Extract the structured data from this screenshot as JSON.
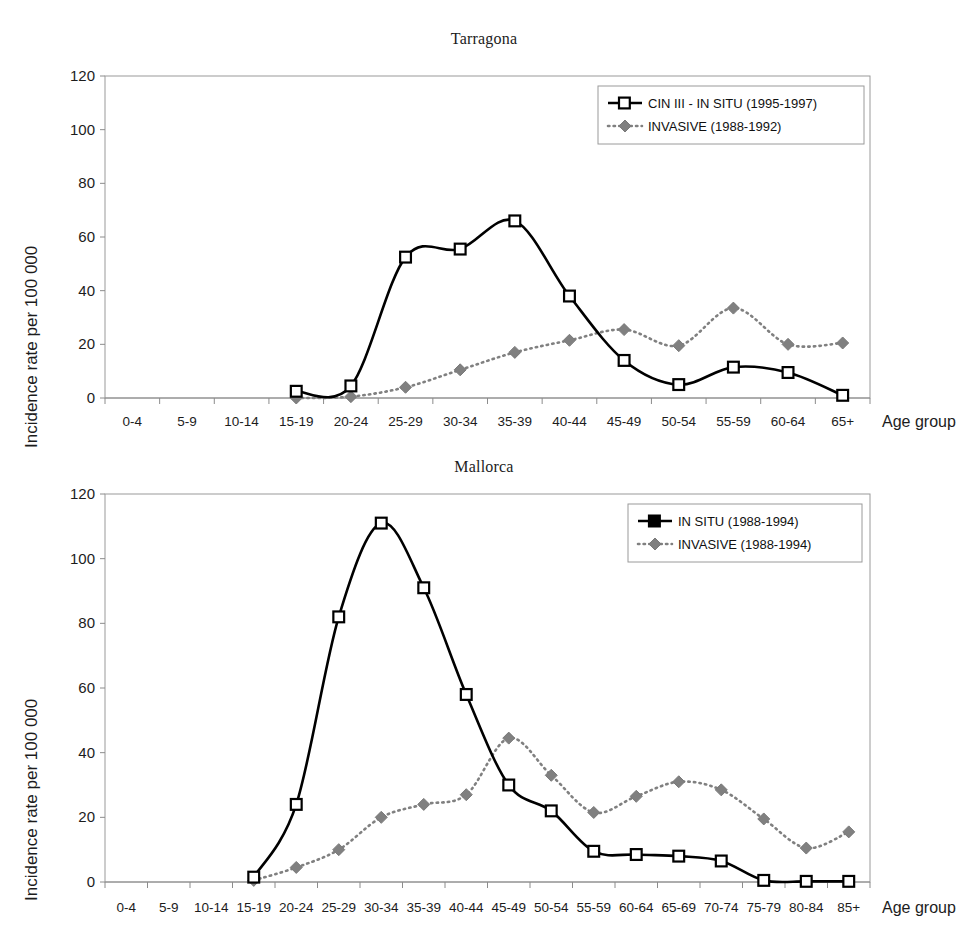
{
  "colors": {
    "insitu": "#000000",
    "invasive": "#808080",
    "axis": "#8c8c8c",
    "frame": "#9a9a9a",
    "text": "#1c1c1c",
    "background": "#ffffff"
  },
  "axis_caption": "Age group",
  "y_axis_title": "Incidence rate per 100 000",
  "charts": [
    {
      "id": "tarragona",
      "title": "Tarragona",
      "legend": {
        "insitu_label": "CIN III - IN SITU (1995-1997)",
        "invasive_label": "INVASIVE (1988-1992)"
      }
    },
    {
      "id": "mallorca",
      "title": "Mallorca",
      "legend": {
        "insitu_label": "IN SITU (1988-1994)",
        "invasive_label": "INVASIVE (1988-1994)"
      }
    }
  ],
  "chart_data": [
    {
      "type": "line",
      "title": "Tarragona",
      "xlabel": "Age group",
      "ylabel": "Incidence rate per 100 000",
      "ylim": [
        0,
        120
      ],
      "yticks": [
        0,
        20,
        40,
        60,
        80,
        100,
        120
      ],
      "grid": false,
      "legend_position": "top-right",
      "categories": [
        "0-4",
        "5-9",
        "10-14",
        "15-19",
        "20-24",
        "25-29",
        "30-34",
        "35-39",
        "40-44",
        "45-49",
        "50-54",
        "55-59",
        "60-64",
        "65+"
      ],
      "series": [
        {
          "name": "CIN III - IN SITU (1995-1997)",
          "marker": "open-square",
          "line": "solid",
          "color": "#000000",
          "values": [
            null,
            null,
            null,
            2.5,
            4.5,
            52.5,
            55.5,
            66.0,
            38.0,
            14.0,
            5.0,
            11.5,
            9.5,
            1.0
          ]
        },
        {
          "name": "INVASIVE (1988-1992)",
          "marker": "diamond",
          "line": "dotted",
          "color": "#808080",
          "values": [
            null,
            null,
            null,
            0.0,
            0.5,
            4.0,
            10.5,
            17.0,
            21.5,
            25.5,
            19.5,
            33.5,
            20.0,
            20.5
          ]
        }
      ]
    },
    {
      "type": "line",
      "title": "Mallorca",
      "xlabel": "Age group",
      "ylabel": "Incidence rate per 100 000",
      "ylim": [
        0,
        120
      ],
      "yticks": [
        0,
        20,
        40,
        60,
        80,
        100,
        120
      ],
      "grid": false,
      "legend_position": "top-right",
      "categories": [
        "0-4",
        "5-9",
        "10-14",
        "15-19",
        "20-24",
        "25-29",
        "30-34",
        "35-39",
        "40-44",
        "45-49",
        "50-54",
        "55-59",
        "60-64",
        "65-69",
        "70-74",
        "75-79",
        "80-84",
        "85+"
      ],
      "series": [
        {
          "name": "IN SITU (1988-1994)",
          "marker": "open-square",
          "line": "solid",
          "color": "#000000",
          "values": [
            null,
            null,
            null,
            1.5,
            24.0,
            82.0,
            111.0,
            91.0,
            58.0,
            30.0,
            22.0,
            9.5,
            8.5,
            8.0,
            6.5,
            0.5,
            0.2,
            0.2
          ]
        },
        {
          "name": "INVASIVE (1988-1994)",
          "marker": "diamond",
          "line": "dotted",
          "color": "#808080",
          "values": [
            null,
            null,
            null,
            0.5,
            4.5,
            10.0,
            20.0,
            24.0,
            27.0,
            44.5,
            33.0,
            21.5,
            26.5,
            31.0,
            28.5,
            19.5,
            10.5,
            15.5
          ]
        }
      ]
    }
  ]
}
